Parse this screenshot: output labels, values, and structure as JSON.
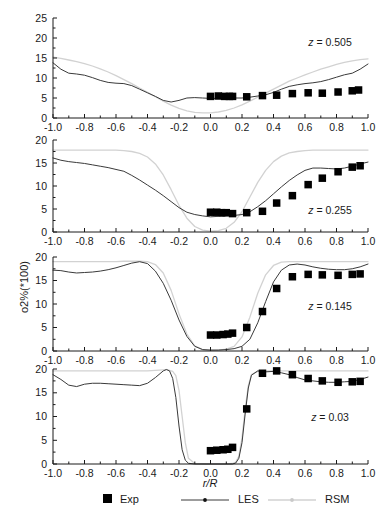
{
  "figure": {
    "y_axis_label": "o2%(*100)",
    "x_axis_label": "r/R"
  },
  "legend": {
    "items": [
      {
        "label": "Exp",
        "marker": "filled-square",
        "color": "#000000"
      },
      {
        "label": "LES",
        "marker": "line-with-dot",
        "color": "#3a3a3a"
      },
      {
        "label": "RSM",
        "marker": "line-with-dot",
        "color": "#d2d2d2"
      }
    ]
  },
  "chart_data": [
    {
      "type": "line",
      "title": "",
      "annotation": "z = 0.505",
      "annotation_variable": "z",
      "annotation_value": "0.505",
      "xlabel": "",
      "ylabel": "o2%(*100)",
      "xlim": [
        -1.0,
        1.0
      ],
      "ylim": [
        0,
        25
      ],
      "xticks": [
        -1.0,
        -0.8,
        -0.6,
        -0.4,
        -0.2,
        0.0,
        0.2,
        0.4,
        0.6,
        0.8,
        1.0
      ],
      "xticklabels": [
        "-1.0",
        "-0.8",
        "-0.6",
        "-0.4",
        "-0.2",
        "0.0",
        "0.2",
        "0.4",
        "0.6",
        "0.8",
        "1.0"
      ],
      "yticks": [
        0,
        5,
        10,
        15,
        20,
        25
      ],
      "yticklabels": [
        "0",
        "5",
        "10",
        "15",
        "20",
        "25"
      ],
      "grid": false,
      "legend_position": "below-figure",
      "series": [
        {
          "name": "LES",
          "type": "line",
          "x": [
            -1.0,
            -0.95,
            -0.9,
            -0.85,
            -0.8,
            -0.75,
            -0.7,
            -0.65,
            -0.6,
            -0.55,
            -0.5,
            -0.45,
            -0.4,
            -0.35,
            -0.3,
            -0.25,
            -0.2,
            -0.15,
            -0.1,
            -0.05,
            0.0,
            0.05,
            0.1,
            0.15,
            0.2,
            0.25,
            0.3,
            0.35,
            0.4,
            0.45,
            0.5,
            0.55,
            0.6,
            0.65,
            0.7,
            0.75,
            0.8,
            0.85,
            0.9,
            0.95,
            1.0
          ],
          "y": [
            13.8,
            12.2,
            11.2,
            11.0,
            10.7,
            10.1,
            9.4,
            8.9,
            8.7,
            8.6,
            8.1,
            7.2,
            6.3,
            5.4,
            4.4,
            4.0,
            4.4,
            5.0,
            5.1,
            5.0,
            4.9,
            4.9,
            4.9,
            5.0,
            5.0,
            5.2,
            5.5,
            5.8,
            6.4,
            7.2,
            7.9,
            8.3,
            8.6,
            8.8,
            9.1,
            9.6,
            10.2,
            10.8,
            11.2,
            12.2,
            13.5
          ]
        },
        {
          "name": "RSM",
          "type": "line",
          "x": [
            -1.0,
            -0.95,
            -0.9,
            -0.85,
            -0.8,
            -0.75,
            -0.7,
            -0.65,
            -0.6,
            -0.55,
            -0.5,
            -0.45,
            -0.4,
            -0.35,
            -0.3,
            -0.25,
            -0.2,
            -0.15,
            -0.1,
            -0.05,
            0.0,
            0.05,
            0.1,
            0.15,
            0.2,
            0.25,
            0.3,
            0.35,
            0.4,
            0.45,
            0.5,
            0.55,
            0.6,
            0.65,
            0.7,
            0.75,
            0.8,
            0.85,
            0.9,
            0.95,
            1.0
          ],
          "y": [
            15.2,
            14.9,
            14.5,
            14.1,
            13.6,
            13.0,
            12.3,
            11.5,
            10.6,
            9.6,
            8.6,
            7.5,
            6.4,
            5.3,
            4.2,
            3.2,
            2.4,
            1.8,
            1.4,
            1.3,
            1.3,
            1.5,
            1.9,
            2.5,
            3.3,
            4.2,
            5.2,
            6.2,
            7.2,
            8.2,
            9.2,
            10.0,
            10.8,
            11.5,
            12.2,
            12.8,
            13.4,
            13.9,
            14.3,
            14.6,
            14.8
          ]
        },
        {
          "name": "Exp",
          "type": "scatter",
          "x": [
            0.0,
            0.05,
            0.09,
            0.12,
            0.14,
            0.23,
            0.33,
            0.42,
            0.52,
            0.62,
            0.71,
            0.81,
            0.9,
            0.94
          ],
          "y": [
            5.4,
            5.5,
            5.4,
            5.4,
            5.4,
            5.3,
            5.6,
            5.7,
            6.1,
            6.3,
            6.2,
            6.5,
            6.8,
            7.0
          ]
        }
      ]
    },
    {
      "type": "line",
      "title": "",
      "annotation": "z = 0.255",
      "annotation_variable": "z",
      "annotation_value": "0.255",
      "xlabel": "",
      "ylabel": "o2%(*100)",
      "xlim": [
        -1.0,
        1.0
      ],
      "ylim": [
        0,
        20
      ],
      "xticks": [
        -1.0,
        -0.8,
        -0.6,
        -0.4,
        -0.2,
        0.0,
        0.2,
        0.4,
        0.6,
        0.8,
        1.0
      ],
      "xticklabels": [
        "-1.0",
        "-0.8",
        "-0.6",
        "-0.4",
        "-0.2",
        "0.0",
        "0.2",
        "0.4",
        "0.6",
        "0.8",
        "1.0"
      ],
      "yticks": [
        0,
        5,
        10,
        15,
        20
      ],
      "yticklabels": [
        "0",
        "5",
        "10",
        "15",
        "20"
      ],
      "grid": false,
      "series": [
        {
          "name": "LES",
          "type": "line",
          "x": [
            -1.0,
            -0.95,
            -0.9,
            -0.85,
            -0.8,
            -0.75,
            -0.7,
            -0.65,
            -0.6,
            -0.55,
            -0.5,
            -0.45,
            -0.4,
            -0.35,
            -0.3,
            -0.25,
            -0.2,
            -0.15,
            -0.1,
            -0.05,
            0.0,
            0.05,
            0.1,
            0.15,
            0.2,
            0.25,
            0.3,
            0.35,
            0.4,
            0.45,
            0.5,
            0.55,
            0.6,
            0.65,
            0.7,
            0.75,
            0.8,
            0.85,
            0.9,
            0.95,
            1.0
          ],
          "y": [
            16.1,
            15.6,
            15.3,
            15.1,
            14.9,
            14.6,
            14.3,
            14.0,
            13.6,
            13.2,
            12.3,
            11.3,
            10.2,
            9.1,
            7.9,
            6.6,
            5.3,
            4.3,
            3.8,
            3.5,
            3.3,
            3.4,
            3.5,
            3.6,
            3.8,
            4.4,
            5.5,
            6.8,
            8.3,
            9.8,
            11.2,
            12.4,
            13.4,
            13.9,
            13.9,
            13.8,
            13.7,
            13.9,
            14.3,
            14.8,
            15.2
          ]
        },
        {
          "name": "RSM",
          "type": "line",
          "x": [
            -1.0,
            -0.95,
            -0.9,
            -0.85,
            -0.8,
            -0.75,
            -0.7,
            -0.65,
            -0.6,
            -0.55,
            -0.5,
            -0.45,
            -0.4,
            -0.35,
            -0.3,
            -0.25,
            -0.2,
            -0.15,
            -0.1,
            -0.05,
            0.0,
            0.05,
            0.1,
            0.15,
            0.2,
            0.25,
            0.3,
            0.35,
            0.4,
            0.45,
            0.5,
            0.55,
            0.6,
            0.65,
            0.7,
            0.75,
            0.8,
            0.85,
            0.9,
            0.95,
            1.0
          ],
          "y": [
            17.8,
            17.8,
            17.8,
            17.8,
            17.8,
            17.8,
            17.8,
            17.8,
            17.8,
            17.7,
            17.5,
            17.1,
            16.3,
            14.8,
            12.4,
            9.2,
            5.8,
            3.0,
            1.2,
            0.4,
            0.2,
            0.3,
            0.8,
            2.1,
            4.4,
            7.6,
            10.8,
            13.4,
            15.3,
            16.5,
            17.2,
            17.5,
            17.7,
            17.8,
            17.8,
            17.8,
            17.8,
            17.8,
            17.8,
            17.8,
            17.8
          ]
        },
        {
          "name": "Exp",
          "type": "scatter",
          "x": [
            0.0,
            0.04,
            0.07,
            0.1,
            0.14,
            0.23,
            0.33,
            0.42,
            0.52,
            0.62,
            0.71,
            0.81,
            0.9,
            0.95
          ],
          "y": [
            4.3,
            4.3,
            4.2,
            4.2,
            4.0,
            4.2,
            4.5,
            6.3,
            7.9,
            10.3,
            11.7,
            13.1,
            14.1,
            14.4
          ]
        }
      ]
    },
    {
      "type": "line",
      "title": "",
      "annotation": "z = 0.145",
      "annotation_variable": "z",
      "annotation_value": "0.145",
      "xlabel": "",
      "ylabel": "o2%(*100)",
      "xlim": [
        -1.0,
        1.0
      ],
      "ylim": [
        0,
        20
      ],
      "xticks": [
        -1.0,
        -0.8,
        -0.6,
        -0.4,
        -0.2,
        0.0,
        0.2,
        0.4,
        0.6,
        0.8,
        1.0
      ],
      "xticklabels": [
        "-1.0",
        "-0.8",
        "-0.6",
        "-0.4",
        "-0.2",
        "0.0",
        "0.2",
        "0.4",
        "0.6",
        "0.8",
        "1.0"
      ],
      "yticks": [
        0,
        5,
        10,
        15,
        20
      ],
      "yticklabels": [
        "0",
        "5",
        "10",
        "15",
        "20"
      ],
      "grid": false,
      "series": [
        {
          "name": "LES",
          "type": "line",
          "x": [
            -1.0,
            -0.95,
            -0.9,
            -0.85,
            -0.8,
            -0.75,
            -0.7,
            -0.65,
            -0.6,
            -0.55,
            -0.5,
            -0.45,
            -0.4,
            -0.35,
            -0.3,
            -0.25,
            -0.2,
            -0.15,
            -0.1,
            -0.05,
            0.0,
            0.05,
            0.1,
            0.15,
            0.2,
            0.25,
            0.3,
            0.35,
            0.4,
            0.45,
            0.5,
            0.55,
            0.6,
            0.65,
            0.7,
            0.75,
            0.8,
            0.85,
            0.9,
            0.95,
            1.0
          ],
          "y": [
            17.2,
            17.1,
            16.8,
            16.6,
            16.7,
            16.8,
            17.0,
            17.3,
            17.7,
            18.2,
            18.7,
            19.0,
            18.6,
            17.0,
            14.4,
            10.8,
            6.6,
            3.1,
            1.0,
            0.3,
            0.2,
            0.2,
            0.3,
            0.5,
            1.0,
            2.5,
            6.0,
            10.5,
            14.7,
            17.2,
            18.3,
            18.5,
            18.3,
            17.9,
            17.6,
            17.4,
            17.3,
            17.3,
            17.5,
            17.9,
            18.5
          ]
        },
        {
          "name": "RSM",
          "type": "line",
          "x": [
            -1.0,
            -0.95,
            -0.9,
            -0.85,
            -0.8,
            -0.75,
            -0.7,
            -0.65,
            -0.6,
            -0.55,
            -0.5,
            -0.45,
            -0.4,
            -0.35,
            -0.3,
            -0.25,
            -0.2,
            -0.15,
            -0.1,
            -0.05,
            0.0,
            0.05,
            0.1,
            0.15,
            0.2,
            0.25,
            0.3,
            0.35,
            0.4,
            0.45,
            0.5,
            0.55,
            0.6,
            0.65,
            0.7,
            0.75,
            0.8,
            0.85,
            0.9,
            0.95,
            1.0
          ],
          "y": [
            19.0,
            19.0,
            19.0,
            19.0,
            19.0,
            19.0,
            19.0,
            19.0,
            19.0,
            19.1,
            19.1,
            19.1,
            19.0,
            18.4,
            16.6,
            12.9,
            7.9,
            3.6,
            1.1,
            0.3,
            0.15,
            0.2,
            0.4,
            1.0,
            3.0,
            7.2,
            12.3,
            16.2,
            18.2,
            18.9,
            19.0,
            19.0,
            19.0,
            19.0,
            19.0,
            19.0,
            19.0,
            19.0,
            19.0,
            19.0,
            19.0
          ]
        },
        {
          "name": "Exp",
          "type": "scatter",
          "x": [
            0.0,
            0.04,
            0.08,
            0.11,
            0.14,
            0.23,
            0.33,
            0.42,
            0.52,
            0.62,
            0.71,
            0.81,
            0.9,
            0.95
          ],
          "y": [
            3.4,
            3.4,
            3.5,
            3.6,
            3.8,
            5.0,
            8.4,
            13.3,
            15.8,
            16.3,
            16.2,
            16.1,
            16.3,
            16.4
          ]
        }
      ]
    },
    {
      "type": "line",
      "title": "",
      "annotation": "z = 0.03",
      "annotation_variable": "z",
      "annotation_value": "0.03",
      "xlabel": "r/R",
      "ylabel": "o2%(*100)",
      "xlim": [
        -1.0,
        1.0
      ],
      "ylim": [
        0,
        20
      ],
      "xticks": [
        -1.0,
        -0.8,
        -0.6,
        -0.4,
        -0.2,
        0.0,
        0.2,
        0.4,
        0.6,
        0.8,
        1.0
      ],
      "xticklabels": [
        "-1.0",
        "-0.8",
        "-0.6",
        "-0.4",
        "-0.2",
        "0.0",
        "0.2",
        "0.4",
        "0.6",
        "0.8",
        "1.0"
      ],
      "yticks": [
        0,
        5,
        10,
        15,
        20
      ],
      "yticklabels": [
        "0",
        "5",
        "10",
        "15",
        "20"
      ],
      "grid": false,
      "series": [
        {
          "name": "LES",
          "type": "line",
          "x": [
            -1.0,
            -0.95,
            -0.9,
            -0.85,
            -0.8,
            -0.75,
            -0.7,
            -0.65,
            -0.6,
            -0.55,
            -0.5,
            -0.45,
            -0.4,
            -0.35,
            -0.3,
            -0.28,
            -0.26,
            -0.24,
            -0.22,
            -0.2,
            -0.18,
            -0.16,
            -0.14,
            -0.1,
            0.0,
            0.1,
            0.14,
            0.16,
            0.18,
            0.2,
            0.22,
            0.24,
            0.26,
            0.3,
            0.35,
            0.4,
            0.45,
            0.5,
            0.55,
            0.6,
            0.65,
            0.7,
            0.75,
            0.8,
            0.85,
            0.9,
            0.95,
            1.0
          ],
          "y": [
            18.8,
            17.8,
            16.6,
            16.3,
            16.8,
            17.0,
            17.0,
            16.9,
            16.8,
            16.7,
            16.6,
            16.5,
            17.0,
            18.2,
            19.6,
            19.9,
            19.6,
            18.0,
            14.0,
            8.0,
            3.0,
            0.8,
            0.15,
            0.0,
            0.0,
            0.0,
            0.0,
            0.2,
            1.2,
            4.5,
            10.5,
            16.0,
            18.7,
            19.6,
            19.4,
            19.5,
            19.2,
            18.8,
            18.2,
            17.7,
            17.5,
            17.3,
            17.2,
            17.2,
            17.3,
            17.4,
            17.8,
            18.3
          ]
        },
        {
          "name": "RSM",
          "type": "line",
          "x": [
            -1.0,
            -0.95,
            -0.9,
            -0.85,
            -0.8,
            -0.75,
            -0.7,
            -0.65,
            -0.6,
            -0.55,
            -0.5,
            -0.45,
            -0.4,
            -0.35,
            -0.3,
            -0.28,
            -0.26,
            -0.24,
            -0.22,
            -0.2,
            -0.18,
            -0.16,
            -0.14,
            -0.1,
            0.0,
            0.1,
            0.14,
            0.16,
            0.18,
            0.2,
            0.22,
            0.24,
            0.26,
            0.3,
            0.35,
            0.4,
            0.45,
            0.5,
            0.55,
            0.6,
            0.65,
            0.7,
            0.75,
            0.8,
            0.85,
            0.9,
            0.95,
            1.0
          ],
          "y": [
            19.6,
            19.6,
            19.6,
            19.6,
            19.6,
            19.6,
            19.6,
            19.6,
            19.6,
            19.6,
            19.6,
            19.6,
            19.6,
            19.7,
            19.8,
            19.8,
            19.7,
            19.5,
            18.6,
            15.5,
            10.0,
            4.5,
            1.2,
            0.1,
            0.0,
            0.0,
            0.1,
            0.4,
            1.6,
            5.5,
            11.5,
            16.5,
            18.8,
            19.5,
            19.6,
            19.6,
            19.6,
            19.6,
            19.6,
            19.6,
            19.6,
            19.6,
            19.6,
            19.6,
            19.6,
            19.6,
            19.6,
            19.6
          ]
        },
        {
          "name": "Exp",
          "type": "scatter",
          "x": [
            0.0,
            0.04,
            0.08,
            0.11,
            0.14,
            0.23,
            0.33,
            0.42,
            0.52,
            0.62,
            0.71,
            0.81,
            0.9,
            0.95
          ],
          "y": [
            2.8,
            2.9,
            3.0,
            3.1,
            3.5,
            11.6,
            19.1,
            19.6,
            18.8,
            18.0,
            17.5,
            17.2,
            17.3,
            17.4
          ]
        }
      ]
    }
  ]
}
